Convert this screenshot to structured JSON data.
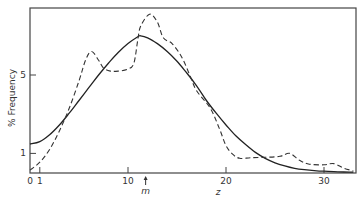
{
  "chart_data": {
    "type": "line",
    "title": "",
    "xlabel": "z",
    "ylabel": "% Frequency",
    "xlim": [
      0,
      33
    ],
    "ylim": [
      0,
      8.4
    ],
    "grid": false,
    "legend": null,
    "x_ticks": [
      {
        "value": 0,
        "label": "0"
      },
      {
        "value": 1,
        "label": "1"
      },
      {
        "value": 10,
        "label": "10"
      },
      {
        "value": 20,
        "label": "20"
      },
      {
        "value": 30,
        "label": "30"
      }
    ],
    "y_ticks": [
      {
        "value": 1,
        "label": "1"
      },
      {
        "value": 5,
        "label": "5"
      }
    ],
    "annotations": [
      {
        "type": "arrow",
        "x": 11.8,
        "label": "m",
        "description": "upward arrow below x-axis marking the mean m"
      }
    ],
    "series": [
      {
        "name": "fitted",
        "style": "solid",
        "points": [
          [
            0,
            1.48
          ],
          [
            1,
            1.6
          ],
          [
            2,
            1.95
          ],
          [
            3,
            2.45
          ],
          [
            4,
            3.05
          ],
          [
            5,
            3.7
          ],
          [
            6,
            4.35
          ],
          [
            7,
            5.0
          ],
          [
            8,
            5.6
          ],
          [
            9,
            6.15
          ],
          [
            10,
            6.6
          ],
          [
            11,
            6.95
          ],
          [
            11.3,
            7.0
          ],
          [
            12,
            6.9
          ],
          [
            13,
            6.6
          ],
          [
            14,
            6.2
          ],
          [
            15,
            5.7
          ],
          [
            16,
            5.1
          ],
          [
            17,
            4.45
          ],
          [
            18,
            3.7
          ],
          [
            19,
            3.05
          ],
          [
            20,
            2.45
          ],
          [
            21,
            1.9
          ],
          [
            22,
            1.45
          ],
          [
            23,
            1.05
          ],
          [
            24,
            0.75
          ],
          [
            25,
            0.52
          ],
          [
            26,
            0.36
          ],
          [
            27,
            0.24
          ],
          [
            28,
            0.17
          ],
          [
            29,
            0.12
          ],
          [
            30,
            0.09
          ],
          [
            31,
            0.07
          ],
          [
            32,
            0.05
          ],
          [
            33,
            0.04
          ]
        ]
      },
      {
        "name": "observed",
        "style": "dashed",
        "points": [
          [
            0,
            0.15
          ],
          [
            1,
            0.55
          ],
          [
            2,
            1.2
          ],
          [
            3,
            2.15
          ],
          [
            4,
            3.3
          ],
          [
            5,
            4.7
          ],
          [
            5.7,
            5.8
          ],
          [
            6.3,
            6.2
          ],
          [
            7,
            5.75
          ],
          [
            7.5,
            5.35
          ],
          [
            8.2,
            5.2
          ],
          [
            9,
            5.2
          ],
          [
            10,
            5.3
          ],
          [
            10.6,
            5.6
          ],
          [
            11,
            6.8
          ],
          [
            11.3,
            7.5
          ],
          [
            12.2,
            8.1
          ],
          [
            13,
            7.7
          ],
          [
            13.6,
            6.9
          ],
          [
            14.5,
            6.6
          ],
          [
            15.5,
            5.9
          ],
          [
            16.3,
            5.0
          ],
          [
            17,
            4.2
          ],
          [
            18.4,
            3.3
          ],
          [
            19.3,
            2.3
          ],
          [
            20,
            1.4
          ],
          [
            20.7,
            0.95
          ],
          [
            21.4,
            0.75
          ],
          [
            22.5,
            0.78
          ],
          [
            24,
            0.8
          ],
          [
            25.5,
            0.85
          ],
          [
            26.5,
            1.0
          ],
          [
            27.5,
            0.65
          ],
          [
            28.5,
            0.45
          ],
          [
            30,
            0.42
          ],
          [
            31,
            0.48
          ],
          [
            32,
            0.25
          ],
          [
            33,
            0.1
          ]
        ]
      }
    ]
  },
  "plot": {
    "frame": {
      "x0": 30,
      "y0": 8,
      "x1": 356,
      "y1": 173
    },
    "px_per_x": 9.8,
    "px_per_y": 19.6
  }
}
